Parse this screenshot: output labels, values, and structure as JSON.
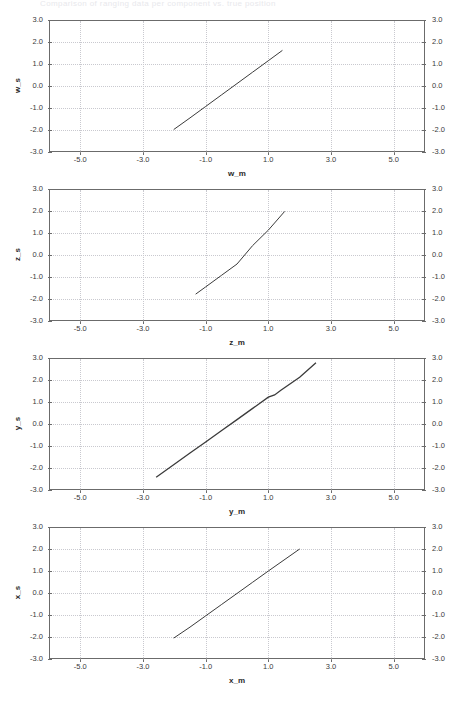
{
  "header": {
    "faint_title": "Comparison of ranging data per component vs. true position"
  },
  "layout": {
    "canvas_width": 463,
    "canvas_height": 712,
    "plot_left": 49,
    "plot_right": 425,
    "panel_tops": [
      20,
      189,
      358,
      527
    ],
    "plot_height": 132,
    "panel_pitch": 169
  },
  "style": {
    "frame_color": "#6b6b6b",
    "grid_color": "#c9c9cf",
    "series_color": "#3b3b3b",
    "tick_label_color": "#3a3a3a",
    "axis_title_color": "#2a2a2a",
    "background": "#ffffff"
  },
  "chart_data": [
    {
      "type": "line",
      "title": "",
      "xlabel": "w_m",
      "ylabel": "w_s",
      "xlim": [
        -6.0,
        6.0
      ],
      "ylim": [
        -3.0,
        3.0
      ],
      "xticks": [
        -5.0,
        -3.0,
        -1.0,
        1.0,
        3.0,
        5.0
      ],
      "xtick_labels": [
        "-5.0",
        "-3.0",
        "-1.0",
        "1.0",
        "3.0",
        "5.0"
      ],
      "yticks": [
        3.0,
        2.0,
        1.0,
        0.0,
        -1.0,
        -2.0,
        -3.0
      ],
      "ytick_labels": [
        "3.0",
        "2.0",
        "1.0",
        "0.0",
        "-1.0",
        "-2.0",
        "-3.0"
      ],
      "right_ytick_labels": [
        "3.0",
        "2.0",
        "1.0",
        "0.0",
        "-1.0",
        "-2.0",
        "-3.0"
      ],
      "grid": true,
      "legend": null,
      "series": [
        {
          "name": "w_s vs w_m",
          "x": [
            -2.02,
            -1.5,
            -1.0,
            -0.5,
            0.0,
            0.5,
            1.0,
            1.45
          ],
          "y": [
            -1.98,
            -1.45,
            -0.93,
            -0.41,
            0.11,
            0.63,
            1.15,
            1.62
          ]
        }
      ]
    },
    {
      "type": "line",
      "title": "",
      "xlabel": "z_m",
      "ylabel": "z_s",
      "xlim": [
        -6.0,
        6.0
      ],
      "ylim": [
        -3.0,
        3.0
      ],
      "xticks": [
        -5.0,
        -3.0,
        -1.0,
        1.0,
        3.0,
        5.0
      ],
      "xtick_labels": [
        "-5.0",
        "-3.0",
        "-1.0",
        "1.0",
        "3.0",
        "5.0"
      ],
      "yticks": [
        3.0,
        2.0,
        1.0,
        0.0,
        -1.0,
        -2.0,
        -3.0
      ],
      "ytick_labels": [
        "3.0",
        "2.0",
        "1.0",
        "0.0",
        "-1.0",
        "-2.0",
        "-3.0"
      ],
      "right_ytick_labels": [
        "3.0",
        "2.0",
        "1.0",
        "0.0",
        "-1.0",
        "-2.0",
        "-3.0"
      ],
      "grid": true,
      "legend": null,
      "series": [
        {
          "name": "z_s vs z_m",
          "x": [
            -1.32,
            -1.0,
            -0.5,
            0.0,
            0.5,
            1.0,
            1.52
          ],
          "y": [
            -1.78,
            -1.45,
            -0.93,
            -0.41,
            0.43,
            1.13,
            1.98
          ]
        }
      ]
    },
    {
      "type": "line",
      "title": "",
      "xlabel": "y_m",
      "ylabel": "y_s",
      "xlim": [
        -6.0,
        6.0
      ],
      "ylim": [
        -3.0,
        3.0
      ],
      "xticks": [
        -5.0,
        -3.0,
        -1.0,
        1.0,
        3.0,
        5.0
      ],
      "xtick_labels": [
        "-5.0",
        "-3.0",
        "-1.0",
        "1.0",
        "3.0",
        "5.0"
      ],
      "yticks": [
        3.0,
        2.0,
        1.0,
        0.0,
        -1.0,
        -2.0,
        -3.0
      ],
      "ytick_labels": [
        "3.0",
        "2.0",
        "1.0",
        "0.0",
        "-1.0",
        "-2.0",
        "-3.0"
      ],
      "right_ytick_labels": [
        "3.0",
        "2.0",
        "1.0",
        "0.0",
        "-1.0",
        "-2.0",
        "-3.0"
      ],
      "grid": true,
      "legend": null,
      "series": [
        {
          "name": "y_s vs y_m",
          "x": [
            -2.58,
            -2.0,
            -1.5,
            -1.0,
            -0.5,
            0.0,
            0.5,
            1.0,
            1.2,
            1.4,
            2.0,
            2.52
          ],
          "y": [
            -2.42,
            -1.83,
            -1.32,
            -0.82,
            -0.31,
            0.2,
            0.71,
            1.22,
            1.32,
            1.53,
            2.12,
            2.78
          ]
        }
      ]
    },
    {
      "type": "line",
      "title": "",
      "xlabel": "x_m",
      "ylabel": "x_s",
      "xlim": [
        -6.0,
        6.0
      ],
      "ylim": [
        -3.0,
        3.0
      ],
      "xticks": [
        -5.0,
        -3.0,
        -1.0,
        1.0,
        3.0,
        5.0
      ],
      "xtick_labels": [
        "-5.0",
        "-3.0",
        "-1.0",
        "1.0",
        "3.0",
        "5.0"
      ],
      "yticks": [
        3.0,
        2.0,
        1.0,
        0.0,
        -1.0,
        -2.0,
        -3.0
      ],
      "ytick_labels": [
        "3.0",
        "2.0",
        "1.0",
        "0.0",
        "-1.0",
        "-2.0",
        "-3.0"
      ],
      "right_ytick_labels": [
        "3.0",
        "2.0",
        "1.0",
        "0.0",
        "-1.0",
        "-2.0",
        "-3.0"
      ],
      "grid": true,
      "legend": null,
      "series": [
        {
          "name": "x_s vs x_m",
          "x": [
            -2.02,
            -1.5,
            -1.0,
            -0.5,
            0.0,
            0.5,
            1.0,
            1.5,
            2.0
          ],
          "y": [
            -2.05,
            -1.55,
            -1.04,
            -0.53,
            -0.02,
            0.49,
            1.0,
            1.5,
            2.0
          ]
        }
      ]
    }
  ]
}
